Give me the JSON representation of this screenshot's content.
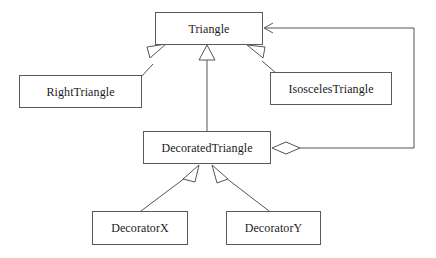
{
  "diagram": {
    "type": "uml-class-diagram",
    "background_color": "#ffffff",
    "line_color": "#555555",
    "box_border_color": "#5a5a5a",
    "text_color": "#1a1a1a",
    "classes": [
      {
        "id": "triangle",
        "label": "Triangle",
        "x": 155,
        "y": 12,
        "width": 108,
        "height": 33
      },
      {
        "id": "right-triangle",
        "label": "RightTriangle",
        "x": 19,
        "y": 75,
        "width": 123,
        "height": 33
      },
      {
        "id": "isosceles-triangle",
        "label": "IsoscelesTriangle",
        "x": 270,
        "y": 72,
        "width": 122,
        "height": 33
      },
      {
        "id": "decorated-triangle",
        "label": "DecoratedTriangle",
        "x": 143,
        "y": 131,
        "width": 128,
        "height": 33
      },
      {
        "id": "decorator-x",
        "label": "DecoratorX",
        "x": 92,
        "y": 211,
        "width": 96,
        "height": 34
      },
      {
        "id": "decorator-y",
        "label": "DecoratorY",
        "x": 226,
        "y": 211,
        "width": 95,
        "height": 34
      }
    ],
    "relationships": [
      {
        "id": "rel-right-triangle-inherits-triangle",
        "kind": "generalization",
        "from": "right-triangle",
        "to": "triangle",
        "arrow": "hollow-triangle"
      },
      {
        "id": "rel-decorated-triangle-inherits-triangle",
        "kind": "generalization",
        "from": "decorated-triangle",
        "to": "triangle",
        "arrow": "hollow-triangle"
      },
      {
        "id": "rel-isosceles-triangle-inherits-triangle",
        "kind": "generalization",
        "from": "isosceles-triangle",
        "to": "triangle",
        "arrow": "hollow-triangle"
      },
      {
        "id": "rel-decorator-x-inherits-decorated-triangle",
        "kind": "generalization",
        "from": "decorator-x",
        "to": "decorated-triangle",
        "arrow": "hollow-triangle"
      },
      {
        "id": "rel-decorator-y-inherits-decorated-triangle",
        "kind": "generalization",
        "from": "decorator-y",
        "to": "decorated-triangle",
        "arrow": "hollow-triangle"
      },
      {
        "id": "rel-decorated-triangle-aggregates-triangle",
        "kind": "aggregation",
        "from": "decorated-triangle",
        "to": "triangle",
        "arrow": "open-arrow",
        "source_decoration": "hollow-diamond"
      }
    ]
  }
}
